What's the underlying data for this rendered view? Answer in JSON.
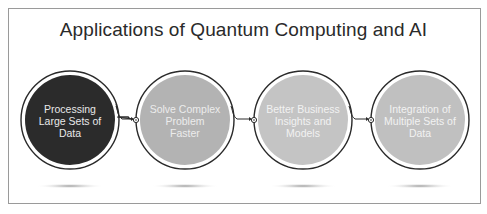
{
  "title": "Applications of Quantum Computing and AI",
  "steps": [
    {
      "label": "Processing Large Sets of Data",
      "lines": [
        "Processing",
        "Large Sets of",
        "Data"
      ],
      "fill": "#2b2b2b",
      "text_color": "#e8e8e8"
    },
    {
      "label": "Solve Complex Problem Faster",
      "lines": [
        "Solve Complex",
        "Problem",
        "Faster"
      ],
      "fill": "#b3b3b3",
      "text_color": "#ececec"
    },
    {
      "label": "Better Business Insights and Models",
      "lines": [
        "Better Business",
        "Insights and",
        "Models"
      ],
      "fill": "#c4c4c4",
      "text_color": "#f2f2f2"
    },
    {
      "label": "Integration of Multiple Sets of Data",
      "lines": [
        "Integration of",
        "Multiple Sets of",
        "Data"
      ],
      "fill": "#c0c0c0",
      "text_color": "#f2f2f2"
    }
  ],
  "colors": {
    "ring": "#2a2a2a",
    "frame": "#9a9a9a",
    "shadow": "#9c9c9c"
  }
}
